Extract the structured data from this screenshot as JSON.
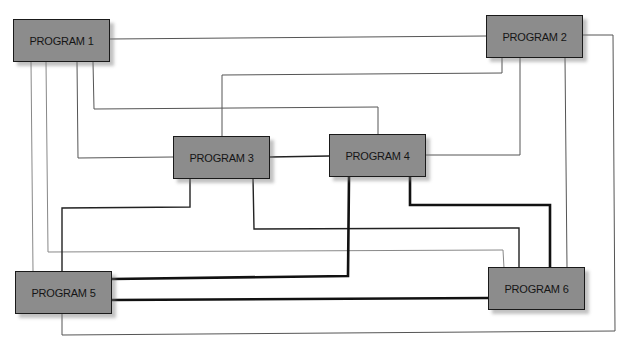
{
  "diagram": {
    "type": "program-interconnection-diagram",
    "nodes": [
      {
        "id": "p1",
        "label": "PROGRAM 1"
      },
      {
        "id": "p2",
        "label": "PROGRAM 2"
      },
      {
        "id": "p3",
        "label": "PROGRAM 3"
      },
      {
        "id": "p4",
        "label": "PROGRAM 4"
      },
      {
        "id": "p5",
        "label": "PROGRAM 5"
      },
      {
        "id": "p6",
        "label": "PROGRAM 6"
      }
    ],
    "edges": [
      {
        "from": "PROGRAM 1",
        "to": "PROGRAM 2",
        "weight": "thin"
      },
      {
        "from": "PROGRAM 1",
        "to": "PROGRAM 3",
        "weight": "thin"
      },
      {
        "from": "PROGRAM 1",
        "to": "PROGRAM 4",
        "weight": "thin"
      },
      {
        "from": "PROGRAM 1",
        "to": "PROGRAM 5",
        "weight": "thin"
      },
      {
        "from": "PROGRAM 1",
        "to": "PROGRAM 6",
        "weight": "thin"
      },
      {
        "from": "PROGRAM 2",
        "to": "PROGRAM 3",
        "weight": "thin"
      },
      {
        "from": "PROGRAM 2",
        "to": "PROGRAM 4",
        "weight": "thin"
      },
      {
        "from": "PROGRAM 2",
        "to": "PROGRAM 5",
        "weight": "thin"
      },
      {
        "from": "PROGRAM 2",
        "to": "PROGRAM 6",
        "weight": "thin"
      },
      {
        "from": "PROGRAM 3",
        "to": "PROGRAM 4",
        "weight": "medium"
      },
      {
        "from": "PROGRAM 3",
        "to": "PROGRAM 5",
        "weight": "medium"
      },
      {
        "from": "PROGRAM 3",
        "to": "PROGRAM 6",
        "weight": "medium"
      },
      {
        "from": "PROGRAM 4",
        "to": "PROGRAM 5",
        "weight": "thick"
      },
      {
        "from": "PROGRAM 4",
        "to": "PROGRAM 6",
        "weight": "thick"
      },
      {
        "from": "PROGRAM 5",
        "to": "PROGRAM 6",
        "weight": "thick"
      }
    ],
    "colors": {
      "node_fill": "#8c8c8c",
      "node_border": "#1a1a1a",
      "line": "#222222",
      "background": "#ffffff"
    }
  }
}
